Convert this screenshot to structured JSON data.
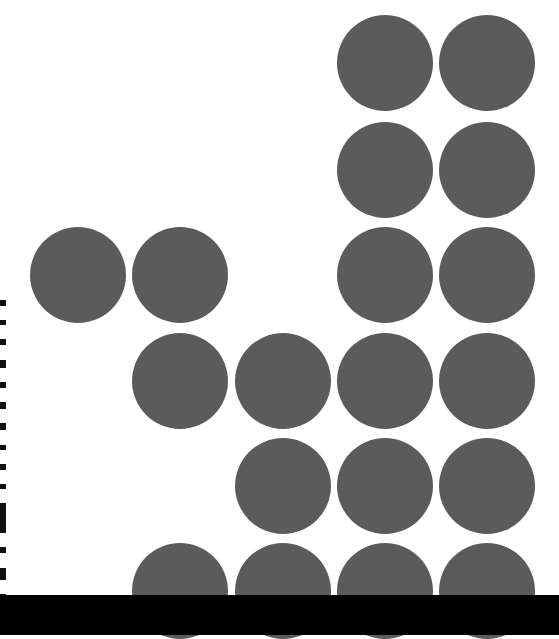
{
  "page": {
    "background": "#ffffff",
    "dot_color": "#5b5b5b",
    "bar_color": "#000000"
  },
  "grid": {
    "diameter": 96,
    "column_centers_x": [
      78,
      180,
      283,
      385,
      487
    ],
    "row_centers_y": [
      63,
      170,
      275,
      381,
      486,
      591
    ],
    "dots": [
      {
        "row": 0,
        "col": 3
      },
      {
        "row": 0,
        "col": 4
      },
      {
        "row": 1,
        "col": 3
      },
      {
        "row": 1,
        "col": 4
      },
      {
        "row": 2,
        "col": 0
      },
      {
        "row": 2,
        "col": 1
      },
      {
        "row": 2,
        "col": 3
      },
      {
        "row": 2,
        "col": 4
      },
      {
        "row": 3,
        "col": 1
      },
      {
        "row": 3,
        "col": 2
      },
      {
        "row": 3,
        "col": 3
      },
      {
        "row": 3,
        "col": 4
      },
      {
        "row": 4,
        "col": 2
      },
      {
        "row": 4,
        "col": 3
      },
      {
        "row": 4,
        "col": 4
      },
      {
        "row": 5,
        "col": 1
      },
      {
        "row": 5,
        "col": 2
      },
      {
        "row": 5,
        "col": 3
      },
      {
        "row": 5,
        "col": 4
      }
    ]
  },
  "edge_text": {
    "note": "",
    "segments": [
      6,
      5,
      6,
      8,
      6,
      7,
      7,
      5,
      6,
      5,
      30,
      6,
      12,
      6
    ]
  }
}
